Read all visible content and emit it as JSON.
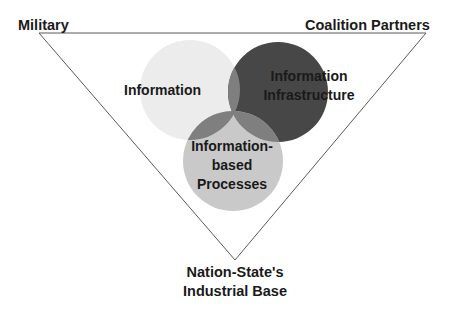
{
  "diagram": {
    "title": "",
    "corners": {
      "top_left": "Military",
      "top_right": "Coalition Partners",
      "bottom": {
        "line1": "Nation-State's",
        "line2": "Industrial Base"
      }
    },
    "circles": [
      {
        "id": "information",
        "label_lines": [
          "Information"
        ],
        "color": "#ececec"
      },
      {
        "id": "infrastructure",
        "label_lines": [
          "Information",
          "Infrastructure"
        ],
        "color": "#474747"
      },
      {
        "id": "processes",
        "label_lines": [
          "Information-",
          "based",
          "Processes"
        ],
        "color": "#c9c9c9"
      }
    ],
    "overlap_color": "#7f7f7f",
    "triangle_color": "#555555"
  }
}
